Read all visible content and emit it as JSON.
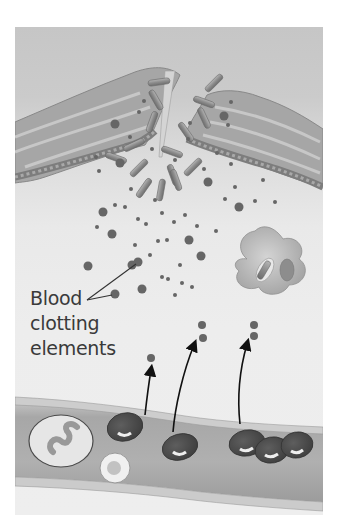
{
  "figure": {
    "labels": {
      "clotting_line1": "Blood",
      "clotting_line2": "clotting",
      "clotting_line3": "elements"
    },
    "colors": {
      "background_upper": "#c6c6c6",
      "background_lower": "#eeeeee",
      "skin_tissue": "#a9a9a9",
      "particle": "#666666",
      "red_blood_cell": "#4a4a4a",
      "vessel": "#b3b3b3",
      "label_text": "#3a3a3a"
    },
    "elements": {
      "skin_flaps": 2,
      "wound_opening": "center top",
      "bacteria_rods": "scattered in wound",
      "macrophage": "right middle",
      "blood_vessel": "bottom horizontal",
      "white_blood_cells": 2,
      "red_blood_cells": 5,
      "arrows_out_of_vessel": 3
    }
  }
}
